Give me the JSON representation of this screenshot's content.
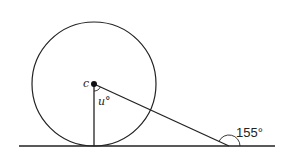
{
  "diagram": {
    "type": "geometry",
    "colors": {
      "stroke": "#222222",
      "background": "#ffffff"
    },
    "circle": {
      "center_label": "c",
      "cx": 94,
      "cy": 84,
      "r": 62
    },
    "baseline": {
      "x1": 19,
      "y1": 146,
      "x2": 275,
      "y2": 146
    },
    "radius_segment": {
      "x1": 94,
      "y1": 84,
      "x2": 94,
      "y2": 146
    },
    "slant_segment": {
      "x1": 94,
      "y1": 84,
      "x2": 229,
      "y2": 146
    },
    "labels": {
      "center": "c",
      "angle_at_center": "u°",
      "exterior_angle": "155°"
    }
  }
}
